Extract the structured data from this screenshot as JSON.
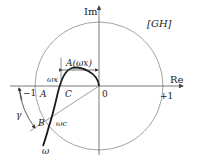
{
  "diagram": {
    "type": "nyquist-plot",
    "plane_label": "[GH]",
    "axes": {
      "real_label": "Re",
      "imag_label": "Im"
    },
    "ticks": {
      "minus_one": "−1",
      "zero": "0",
      "plus_one": "+1"
    },
    "points": {
      "A": "A",
      "B": "B",
      "C": "C"
    },
    "annotations": {
      "gain_margin_distance": "A(ωx)",
      "phase_crossover": "ωx",
      "gain_crossover": "ωc",
      "phase_margin": "γ",
      "frequency": "ω"
    },
    "unit_circle": {
      "radius_label": "1"
    },
    "colors": {
      "curve": "#1a1a1a",
      "circle": "#888888",
      "axis": "#555555"
    }
  }
}
